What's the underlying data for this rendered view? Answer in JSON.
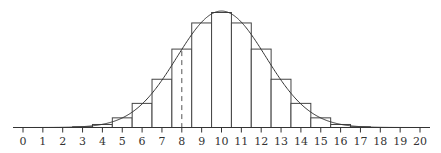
{
  "chart_data": {
    "type": "bar",
    "title": "",
    "xlabel": "",
    "ylabel": "",
    "categories": [
      "0",
      "1",
      "2",
      "3",
      "4",
      "5",
      "6",
      "7",
      "8",
      "9",
      "10",
      "11",
      "12",
      "13",
      "14",
      "15",
      "16",
      "17",
      "18",
      "19",
      "20"
    ],
    "values": [
      1e-06,
      1.9e-05,
      0.000181,
      0.001087,
      0.004621,
      0.014786,
      0.036964,
      0.073929,
      0.120134,
      0.160179,
      0.176197,
      0.160179,
      0.120134,
      0.073929,
      0.036964,
      0.014786,
      0.004621,
      0.001087,
      0.000181,
      1.9e-05,
      1e-06
    ],
    "series": [
      {
        "name": "binomial",
        "type": "bar"
      },
      {
        "name": "normal approximation",
        "type": "line",
        "mean": 10,
        "sd": 2.2361
      }
    ],
    "annotations": [
      {
        "type": "dashed-vertical-line",
        "x": 8
      }
    ],
    "xlim": [
      -0.5,
      20.5
    ],
    "ylim": [
      0,
      0.18
    ],
    "grid": false,
    "legend": null
  }
}
